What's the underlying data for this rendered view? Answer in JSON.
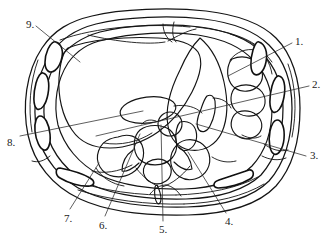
{
  "figure": {
    "background_color": "#ffffff",
    "ink_color": "#141414",
    "width": 327,
    "height": 237
  },
  "labels": [
    {
      "id": "label-1",
      "text": "1.",
      "x": 295,
      "y": 36
    },
    {
      "id": "label-2",
      "text": "2.",
      "x": 312,
      "y": 79
    },
    {
      "id": "label-3",
      "text": "3.",
      "x": 310,
      "y": 150
    },
    {
      "id": "label-4",
      "text": "4.",
      "x": 225,
      "y": 216
    },
    {
      "id": "label-5",
      "text": "5.",
      "x": 159,
      "y": 224
    },
    {
      "id": "label-6",
      "text": "6.",
      "x": 99,
      "y": 220
    },
    {
      "id": "label-7",
      "text": "7.",
      "x": 64,
      "y": 213
    },
    {
      "id": "label-8",
      "text": "8.",
      "x": 7,
      "y": 137
    },
    {
      "id": "label-9",
      "text": "9.",
      "x": 26,
      "y": 19
    }
  ],
  "leaders": [
    {
      "id": "leader-1",
      "from_label": "1.",
      "path": "M 292 43 L 228 76"
    },
    {
      "id": "leader-2",
      "from_label": "2.",
      "path": "M 309 86 L 96 136"
    },
    {
      "id": "leader-3",
      "from_label": "3.",
      "path": "M 306 156 L 196 124"
    },
    {
      "id": "leader-4",
      "from_label": "4.",
      "path": "M 226 213 L 188 152"
    },
    {
      "id": "leader-5",
      "from_label": "5.",
      "path": "M 163 221 L 161 125"
    },
    {
      "id": "leader-6",
      "from_label": "6.",
      "path": "M 105 216 L 140 134"
    },
    {
      "id": "leader-7",
      "from_label": "7.",
      "path": "M 70 209 L 99 163"
    },
    {
      "id": "leader-8",
      "from_label": "8.",
      "path": "M 20 136 L 143 111"
    },
    {
      "id": "leader-9",
      "from_label": "9.",
      "path": "M 36 26 L 80 62"
    }
  ],
  "structures": [
    {
      "id": "outer-body-wall",
      "name": "outer-body-wall-contour"
    },
    {
      "id": "subcutaneous-layer",
      "name": "subcutaneous-fat-layer"
    },
    {
      "id": "muscle-layer",
      "name": "abdominal-muscle-layer"
    },
    {
      "id": "peritoneal-contour",
      "name": "peritoneal-cavity-contour"
    },
    {
      "id": "liver",
      "name": "liver-outline"
    },
    {
      "id": "stomach",
      "name": "stomach-outline"
    },
    {
      "id": "spleen",
      "name": "spleen-lobulated-outline"
    },
    {
      "id": "vertebra",
      "name": "vertebral-body"
    },
    {
      "id": "spinal-canal",
      "name": "spinal-canal"
    },
    {
      "id": "spinous-process",
      "name": "spinous-process"
    },
    {
      "id": "aorta",
      "name": "aorta-circle"
    },
    {
      "id": "ivc",
      "name": "inferior-vena-cava"
    },
    {
      "id": "pancreas",
      "name": "pancreas-oval"
    },
    {
      "id": "ribs-left",
      "name": "left-rib-cross-sections"
    },
    {
      "id": "ribs-right",
      "name": "right-rib-cross-sections"
    },
    {
      "id": "paraspinal-muscles",
      "name": "paraspinal-muscle-group"
    }
  ]
}
